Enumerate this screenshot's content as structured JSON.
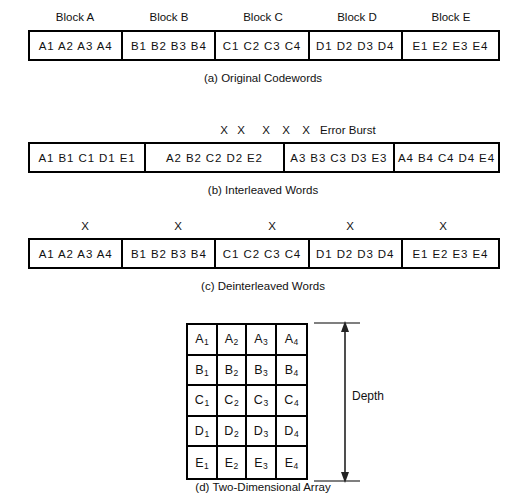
{
  "figure": {
    "background_color": "#ffffff",
    "ink_color": "#111111"
  },
  "panel_a": {
    "caption": "(a) Original Codewords",
    "block_labels": [
      "Block A",
      "Block B",
      "Block C",
      "Block D",
      "Block E"
    ],
    "cells": [
      "A1  A2  A3  A4",
      "B1  B2  B3  B4",
      "C1  C2  C3  C4",
      "D1  D2  D3  D4",
      "E1  E2  E3  E4"
    ]
  },
  "panel_b": {
    "caption": "(b) Interleaved Words",
    "cells": [
      "A1  B1  C1  D1  E1",
      "A2  B2  C2  D2  E2",
      "A3  B3  C3  D3  E3",
      "A4  B4  C4  D4  E4"
    ],
    "error_marks": [
      "X",
      "X",
      "X",
      "X",
      "X"
    ],
    "error_mark_x": [
      224,
      241,
      266,
      286,
      306
    ],
    "burst_label": "Error Burst"
  },
  "panel_c": {
    "caption": "(c) Deinterleaved Words",
    "cells": [
      "A1  A2  A3  A4",
      "B1  B2  B3  B4",
      "C1  C2  C3  C4",
      "D1  D2  D3  D4",
      "E1  E2  E3  E4"
    ],
    "error_marks": [
      "X",
      "X",
      "X",
      "X",
      "X"
    ],
    "error_mark_x": [
      85,
      178,
      272,
      350,
      443
    ]
  },
  "panel_d": {
    "caption": "(d) Two-Dimensional Array",
    "depth_label": "Depth",
    "rows": [
      [
        {
          "letter": "A",
          "index": "1"
        },
        {
          "letter": "A",
          "index": "2"
        },
        {
          "letter": "A",
          "index": "3"
        },
        {
          "letter": "A",
          "index": "4"
        }
      ],
      [
        {
          "letter": "B",
          "index": "1"
        },
        {
          "letter": "B",
          "index": "2"
        },
        {
          "letter": "B",
          "index": "3"
        },
        {
          "letter": "B",
          "index": "4"
        }
      ],
      [
        {
          "letter": "C",
          "index": "1"
        },
        {
          "letter": "C",
          "index": "2"
        },
        {
          "letter": "C",
          "index": "3"
        },
        {
          "letter": "C",
          "index": "4"
        }
      ],
      [
        {
          "letter": "D",
          "index": "1"
        },
        {
          "letter": "D",
          "index": "2"
        },
        {
          "letter": "D",
          "index": "3"
        },
        {
          "letter": "D",
          "index": "4"
        }
      ],
      [
        {
          "letter": "E",
          "index": "1"
        },
        {
          "letter": "E",
          "index": "2"
        },
        {
          "letter": "E",
          "index": "3"
        },
        {
          "letter": "E",
          "index": "4"
        }
      ]
    ]
  }
}
